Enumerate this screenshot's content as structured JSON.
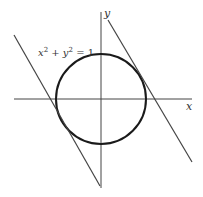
{
  "diagram": {
    "equation": {
      "x": "x",
      "y": "y",
      "sup": "2",
      "plus": " + ",
      "eq": " = 1"
    },
    "axes": {
      "x_label": "x",
      "y_label": "y"
    },
    "colors": {
      "stroke": "#333333",
      "circle": "#1a1a1a",
      "background": "#ffffff"
    }
  }
}
